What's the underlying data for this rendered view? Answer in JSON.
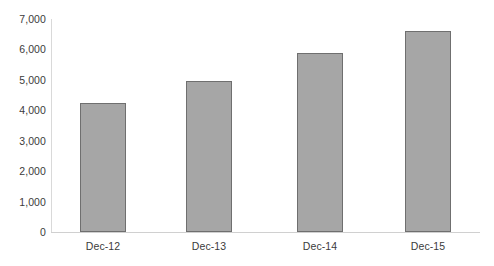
{
  "chart_data": {
    "type": "bar",
    "title": "",
    "subtitle": "",
    "xlabel": "",
    "ylabel": "",
    "categories": [
      "Dec-12",
      "Dec-13",
      "Dec-14",
      "Dec-15"
    ],
    "values": [
      4230,
      4950,
      5880,
      6600
    ],
    "series": [
      {
        "name": "",
        "values": [
          4230,
          4950,
          5880,
          6600
        ]
      }
    ],
    "ylim": [
      0,
      7000
    ],
    "ytick_values": [
      0,
      1000,
      2000,
      3000,
      4000,
      5000,
      6000,
      7000
    ],
    "ytick_labels": [
      "0",
      "1,000",
      "2,000",
      "3,000",
      "4,000",
      "5,000",
      "6,000",
      "7,000"
    ],
    "grid": false,
    "legend": false,
    "legend_position": "none",
    "bar_fill_color": "#a6a6a6",
    "bar_border_color": "#6f6f6f",
    "axis_line_color": "#d9d9d9",
    "text_color": "#3b3b3b",
    "background_color": "#ffffff"
  }
}
